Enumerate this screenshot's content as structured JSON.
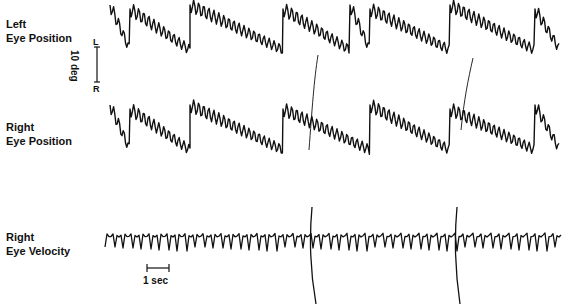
{
  "labels": {
    "left_eye_position": [
      "Left",
      "Eye Position"
    ],
    "right_eye_position": [
      "Right",
      "Eye Position"
    ],
    "right_eye_velocity": [
      "Right",
      "Eye Velocity"
    ]
  },
  "scale_bar": {
    "amplitude": "10 deg",
    "top": "L",
    "bottom": "R",
    "time": "1 sec"
  },
  "colors": {
    "trace": "#111111",
    "background": "#ffffff"
  },
  "chart_data": {
    "type": "line",
    "title": "",
    "xlabel": "time (scale bar 1 sec)",
    "ylabel": "eye position (scale bar 10 deg, L up / R down)",
    "series": [
      {
        "name": "Left Eye Position",
        "pattern": "sawtooth nystagmus with superimposed fast oscillations; slow drift downward, fast phase upward",
        "baseline_y": 30,
        "jumps_x": [
          130,
          190,
          283,
          350,
          370,
          450,
          535
        ]
      },
      {
        "name": "Right Eye Position",
        "pattern": "same as left eye, sawtooth with oscillations",
        "baseline_y": 130,
        "jumps_x": [
          130,
          190,
          283,
          370,
          450,
          535
        ]
      },
      {
        "name": "Right Eye Velocity",
        "pattern": "regular downward spikes (~4 per sec) with two large artifacts",
        "baseline_y": 235,
        "artifacts_x": [
          310,
          455
        ]
      }
    ],
    "grid": false,
    "legend": "labels at left"
  }
}
